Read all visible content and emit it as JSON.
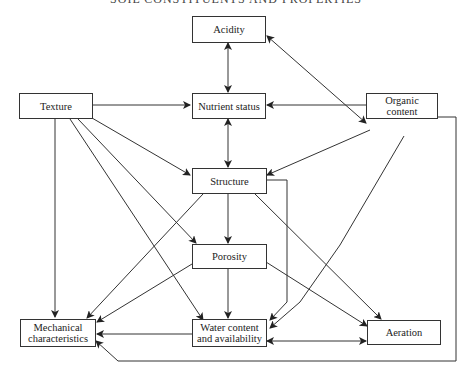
{
  "header": {
    "title": "SOIL CONSTITUENTS AND PROPERTIES"
  },
  "nodes": {
    "acidity": "Acidity",
    "texture": "Texture",
    "nutrient": "Nutrient status",
    "organic_1": "Organic",
    "organic_2": "content",
    "structure": "Structure",
    "porosity": "Porosity",
    "mechanical_1": "Mechanical",
    "mechanical_2": "characteristics",
    "water_1": "Water content",
    "water_2": "and availability",
    "aeration": "Aeration"
  },
  "edges": [
    {
      "from": "Acidity",
      "to": "Nutrient status",
      "bidirectional": true
    },
    {
      "from": "Organic content",
      "to": "Acidity",
      "bidirectional": true
    },
    {
      "from": "Texture",
      "to": "Nutrient status"
    },
    {
      "from": "Organic content",
      "to": "Nutrient status"
    },
    {
      "from": "Nutrient status",
      "to": "Structure",
      "bidirectional": true
    },
    {
      "from": "Texture",
      "to": "Structure"
    },
    {
      "from": "Organic content",
      "to": "Structure"
    },
    {
      "from": "Texture",
      "to": "Mechanical characteristics"
    },
    {
      "from": "Texture",
      "to": "Porosity"
    },
    {
      "from": "Texture",
      "to": "Water content and availability"
    },
    {
      "from": "Structure",
      "to": "Porosity"
    },
    {
      "from": "Structure",
      "to": "Mechanical characteristics"
    },
    {
      "from": "Structure",
      "to": "Water content and availability"
    },
    {
      "from": "Structure",
      "to": "Aeration"
    },
    {
      "from": "Porosity",
      "to": "Mechanical characteristics"
    },
    {
      "from": "Porosity",
      "to": "Water content and availability"
    },
    {
      "from": "Porosity",
      "to": "Aeration"
    },
    {
      "from": "Organic content",
      "to": "Water content and availability"
    },
    {
      "from": "Organic content",
      "to": "Mechanical characteristics"
    },
    {
      "from": "Water content and availability",
      "to": "Mechanical characteristics"
    },
    {
      "from": "Water content and availability",
      "to": "Aeration",
      "bidirectional": true
    }
  ]
}
